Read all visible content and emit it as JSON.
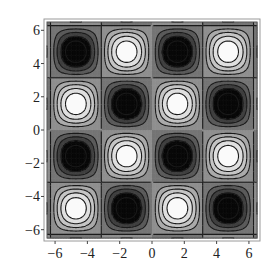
{
  "chart_data": {
    "type": "contour",
    "title": "",
    "function_hint": "cos(x)·cos(y)-like periodic field (bright peaks / dark troughs in 4×4 checkerboard)",
    "xlabel": "",
    "ylabel": "",
    "xlim": [
      -6.5,
      6.5
    ],
    "ylim": [
      -6.5,
      6.5
    ],
    "x_ticks": [
      "-6",
      "-4",
      "-2",
      "0",
      "2",
      "4",
      "6"
    ],
    "y_ticks": [
      "-6",
      "-4",
      "-2",
      "0",
      "2",
      "4",
      "6"
    ],
    "x_tick_values": [
      -6,
      -4,
      -2,
      0,
      2,
      4,
      6
    ],
    "y_tick_values": [
      -6,
      -4,
      -2,
      0,
      2,
      4,
      6
    ],
    "grid": false,
    "legend": null,
    "colormap": "grayscale (black = minimum, white = maximum)",
    "cells": [
      {
        "row": 0,
        "col": 0,
        "kind": "min"
      },
      {
        "row": 0,
        "col": 1,
        "kind": "max"
      },
      {
        "row": 0,
        "col": 2,
        "kind": "min"
      },
      {
        "row": 0,
        "col": 3,
        "kind": "max"
      },
      {
        "row": 1,
        "col": 0,
        "kind": "max"
      },
      {
        "row": 1,
        "col": 1,
        "kind": "min"
      },
      {
        "row": 1,
        "col": 2,
        "kind": "max"
      },
      {
        "row": 1,
        "col": 3,
        "kind": "min"
      },
      {
        "row": 2,
        "col": 0,
        "kind": "min"
      },
      {
        "row": 2,
        "col": 1,
        "kind": "max"
      },
      {
        "row": 2,
        "col": 2,
        "kind": "min"
      },
      {
        "row": 2,
        "col": 3,
        "kind": "max"
      },
      {
        "row": 3,
        "col": 0,
        "kind": "max"
      },
      {
        "row": 3,
        "col": 1,
        "kind": "min"
      },
      {
        "row": 3,
        "col": 2,
        "kind": "max"
      },
      {
        "row": 3,
        "col": 3,
        "kind": "min"
      }
    ],
    "contour_levels": 10
  }
}
